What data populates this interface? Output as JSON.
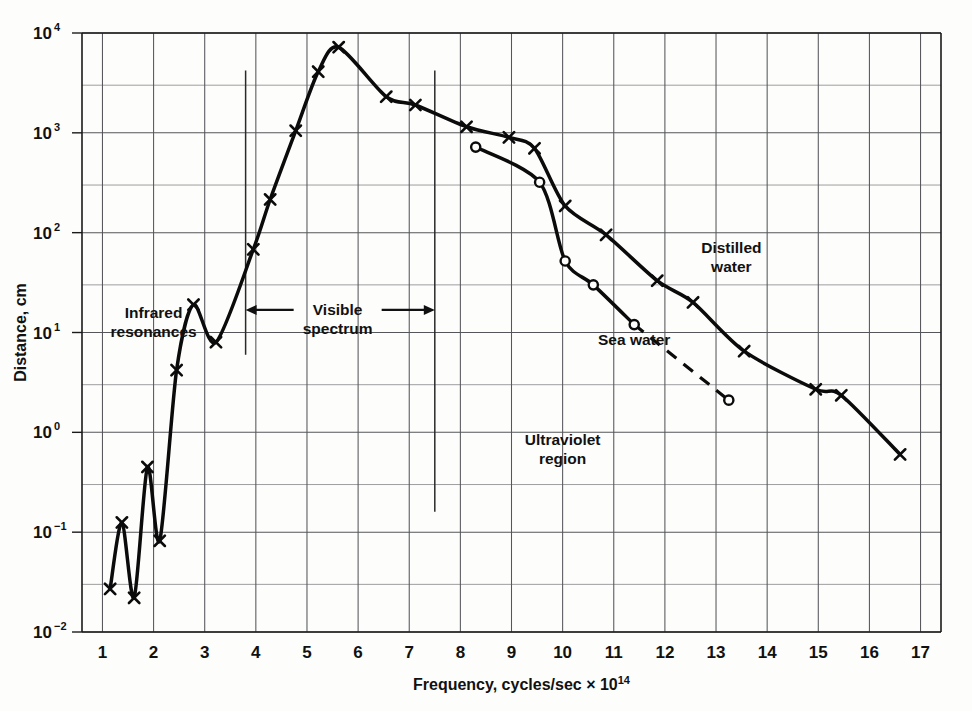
{
  "chart_data": {
    "type": "line",
    "title": "",
    "xlabel": "Frequency, cycles/sec × 10¹⁴",
    "ylabel": "Distance, cm",
    "xlabel_parts": {
      "main": "Frequency,  cycles/sec  × 10",
      "sup": "14"
    },
    "xscale": "linear",
    "yscale": "log",
    "xlim": [
      0.6,
      17.4
    ],
    "ylim": [
      0.01,
      10000
    ],
    "grid": "major decades on y, unit ticks on x, minor half-decade lines on y",
    "legend": "inline annotations",
    "x_ticks": [
      1,
      2,
      3,
      4,
      5,
      6,
      7,
      8,
      9,
      10,
      11,
      12,
      13,
      14,
      15,
      16,
      17
    ],
    "x_tick_labels": [
      "1",
      "2",
      "3",
      "4",
      "5",
      "6",
      "7",
      "8",
      "9",
      "10",
      "11",
      "12",
      "13",
      "14",
      "15",
      "16",
      "17"
    ],
    "y_ticks": [
      0.01,
      0.1,
      1,
      10,
      100,
      1000,
      10000
    ],
    "y_tick_labels": [
      {
        "base": "10",
        "exp": "−2"
      },
      {
        "base": "10",
        "exp": "−1"
      },
      {
        "base": "10",
        "exp": "0"
      },
      {
        "base": "10",
        "exp": "1"
      },
      {
        "base": "10",
        "exp": "2"
      },
      {
        "base": "10",
        "exp": "3"
      },
      {
        "base": "10",
        "exp": "4"
      }
    ],
    "series": [
      {
        "name": "Distilled water",
        "marker": "x",
        "linestyle": "solid",
        "points": [
          {
            "x": 1.15,
            "y": 0.027
          },
          {
            "x": 1.38,
            "y": 0.125
          },
          {
            "x": 1.62,
            "y": 0.022
          },
          {
            "x": 1.88,
            "y": 0.45
          },
          {
            "x": 2.12,
            "y": 0.082
          },
          {
            "x": 2.45,
            "y": 4.2
          },
          {
            "x": 2.78,
            "y": 19.0
          },
          {
            "x": 3.22,
            "y": 8.0
          },
          {
            "x": 3.95,
            "y": 68.0
          },
          {
            "x": 4.28,
            "y": 215.0
          },
          {
            "x": 4.78,
            "y": 1050.0
          },
          {
            "x": 5.22,
            "y": 4100.0
          },
          {
            "x": 5.62,
            "y": 7200.0
          },
          {
            "x": 6.55,
            "y": 2300.0
          },
          {
            "x": 7.12,
            "y": 1900.0
          },
          {
            "x": 8.12,
            "y": 1150.0
          },
          {
            "x": 8.95,
            "y": 900.0
          },
          {
            "x": 9.45,
            "y": 700.0
          },
          {
            "x": 10.05,
            "y": 185.0
          },
          {
            "x": 10.85,
            "y": 95.0
          },
          {
            "x": 11.85,
            "y": 33.0
          },
          {
            "x": 12.55,
            "y": 20.0
          },
          {
            "x": 13.55,
            "y": 6.5
          },
          {
            "x": 14.95,
            "y": 2.7
          },
          {
            "x": 15.45,
            "y": 2.35
          },
          {
            "x": 16.6,
            "y": 0.6
          }
        ]
      },
      {
        "name": "Sea water",
        "marker": "o",
        "linestyle": "solid-then-dashed",
        "dash_starts_at_x": 11.4,
        "points": [
          {
            "x": 8.3,
            "y": 720.0
          },
          {
            "x": 9.55,
            "y": 320.0
          },
          {
            "x": 10.05,
            "y": 52.0
          },
          {
            "x": 10.6,
            "y": 30.0
          },
          {
            "x": 11.4,
            "y": 12.0
          },
          {
            "x": 13.25,
            "y": 2.1
          }
        ]
      }
    ],
    "annotations": [
      {
        "name": "infrared-resonances",
        "lines": [
          "Infrared",
          "resonances"
        ],
        "x": 2.0,
        "y": 14.0
      },
      {
        "name": "visible-spectrum",
        "lines": [
          "Visible",
          "spectrum"
        ],
        "x": 5.6,
        "y": 15.0,
        "arrow_from_x": 3.8,
        "arrow_to_x": 7.5,
        "double_headed": true
      },
      {
        "name": "ultraviolet-region",
        "lines": [
          "Ultraviolet",
          "region"
        ],
        "x": 10.0,
        "y": 0.75
      },
      {
        "name": "distilled-water-label",
        "lines": [
          "Distilled",
          "water"
        ],
        "x": 13.3,
        "y": 62.0
      },
      {
        "name": "sea-water-label",
        "lines": [
          "Sea  water"
        ],
        "x": 11.4,
        "y": 7.5
      }
    ],
    "region_markers": [
      {
        "name": "visible-left-boundary",
        "x": 3.8,
        "y_from": 6.0,
        "y_to": 4200.0
      },
      {
        "name": "visible-right-boundary",
        "x": 7.5,
        "y_from": 0.16,
        "y_to": 4200.0
      }
    ]
  }
}
